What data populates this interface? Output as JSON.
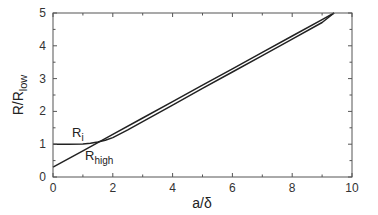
{
  "chart_data": {
    "type": "line",
    "title": "",
    "xlabel": "a/δ",
    "ylabel": "R/R_low",
    "ylabel_main": "R/R",
    "ylabel_sub": "low",
    "xlim": [
      0,
      10
    ],
    "ylim": [
      0,
      5
    ],
    "xticks": [
      0,
      2,
      4,
      6,
      8,
      10
    ],
    "yticks": [
      0,
      1,
      2,
      3,
      4,
      5
    ],
    "grid": false,
    "legend": "none (inline curve labels)",
    "series": [
      {
        "name": "R_i",
        "label_main": "R",
        "label_sub": "i",
        "x": [
          0,
          0.5,
          1.0,
          1.25,
          1.5,
          1.75,
          2.0,
          2.5,
          3,
          4,
          5,
          6,
          7,
          8,
          9,
          9.4
        ],
        "y": [
          1.0,
          1.0,
          1.01,
          1.03,
          1.07,
          1.12,
          1.2,
          1.44,
          1.69,
          2.19,
          2.7,
          3.2,
          3.7,
          4.2,
          4.71,
          5.0
        ]
      },
      {
        "name": "R_high",
        "label_main": "R",
        "label_sub": "high",
        "x": [
          0,
          1,
          2,
          3,
          4,
          5,
          6,
          7,
          8,
          9,
          9.4
        ],
        "y": [
          0.3,
          0.8,
          1.3,
          1.8,
          2.3,
          2.8,
          3.3,
          3.8,
          4.3,
          4.8,
          5.0
        ]
      }
    ]
  }
}
